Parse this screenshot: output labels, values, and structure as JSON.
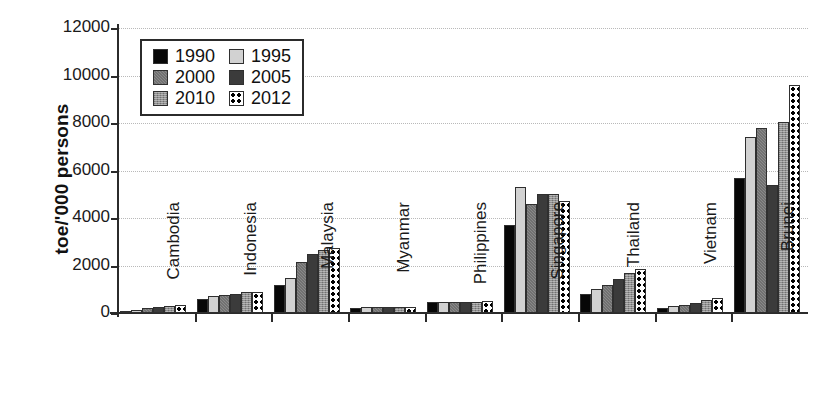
{
  "chart_data": {
    "type": "bar",
    "title": "",
    "subtitle": "",
    "xlabel": "",
    "ylabel": "toe/'000 persons",
    "ylim": [
      0,
      12000
    ],
    "yticks": [
      0,
      2000,
      4000,
      6000,
      8000,
      10000,
      12000
    ],
    "ytick_labels": [
      "0",
      "2000",
      "4000",
      "6000",
      "8000",
      "10000",
      "12000"
    ],
    "grid": true,
    "grid_axis": "y",
    "grid_style": "dotted",
    "legend_position": "upper-left-inside",
    "xtick_rotation": 90,
    "categories": [
      "Cambodia",
      "Indonesia",
      "Malaysia",
      "Myanmar",
      "Philippines",
      "Singapore",
      "Thailand",
      "Vietnam",
      "Brunei"
    ],
    "series": [
      {
        "name": "1990",
        "color": "#070707",
        "pattern": "solid-black",
        "values": [
          80,
          570,
          1180,
          230,
          450,
          3700,
          800,
          230,
          5700
        ]
      },
      {
        "name": "1995",
        "color": "#d2d2d2",
        "pattern": "solid-light-grey",
        "values": [
          140,
          700,
          1480,
          250,
          480,
          5300,
          1000,
          280,
          7400
        ]
      },
      {
        "name": "2000",
        "color": "#8a8a8a",
        "pattern": "hatched-medium-grey",
        "values": [
          210,
          740,
          2130,
          250,
          460,
          4600,
          1200,
          340,
          7800
        ]
      },
      {
        "name": "2005",
        "color": "#3b3b3b",
        "pattern": "solid-dark-grey",
        "values": [
          250,
          790,
          2480,
          250,
          460,
          5000,
          1420,
          430,
          5400
        ]
      },
      {
        "name": "2010",
        "color": "#909090",
        "pattern": "crosshatch-grey",
        "values": [
          310,
          890,
          2650,
          260,
          470,
          5000,
          1680,
          540,
          8050
        ]
      },
      {
        "name": "2012",
        "color": "#ffffff",
        "pattern": "white-with-black-dots",
        "values": [
          340,
          880,
          2750,
          270,
          500,
          4700,
          1850,
          620,
          9600
        ]
      }
    ]
  },
  "axis": {
    "y_title": "toe/'000 persons"
  },
  "legend": {
    "items": [
      {
        "label": "1990"
      },
      {
        "label": "1995"
      },
      {
        "label": "2000"
      },
      {
        "label": "2005"
      },
      {
        "label": "2010"
      },
      {
        "label": "2012"
      }
    ]
  }
}
